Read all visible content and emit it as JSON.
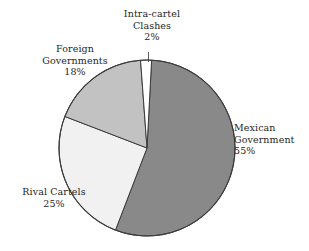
{
  "chart_data": {
    "type": "pie",
    "title": "",
    "subtitle": "",
    "xlabel": "",
    "ylabel": "",
    "legend_position": "none",
    "grid": false,
    "labels_inline": true,
    "units": "percent",
    "total": 100,
    "categories": [
      "Mexican Government",
      "Rival Cartels",
      "Foreign Governments",
      "Intra-cartel Clashes"
    ],
    "values": [
      55,
      25,
      18,
      2
    ],
    "value_labels": [
      "55%",
      "25%",
      "18%",
      "2%"
    ],
    "colors": [
      "#898989",
      "#f1f1f1",
      "#c2c2c2",
      "#ffffff"
    ],
    "start_angle_deg": 3,
    "direction": "clockwise",
    "slices": [
      {
        "name": "Mexican Government",
        "label_line1": "Mexican",
        "label_line2": "Government",
        "value": 55,
        "value_label": "55%",
        "color": "#898989",
        "start_deg": 3,
        "end_deg": 201
      },
      {
        "name": "Rival Cartels",
        "label_line1": "Rival Cartels",
        "label_line2": "",
        "value": 25,
        "value_label": "25%",
        "color": "#f1f1f1",
        "start_deg": 201,
        "end_deg": 291
      },
      {
        "name": "Foreign Governments",
        "label_line1": "Foreign",
        "label_line2": "Governments",
        "value": 18,
        "value_label": "18%",
        "color": "#c2c2c2",
        "start_deg": 291,
        "end_deg": 355.8
      },
      {
        "name": "Intra-cartel Clashes",
        "label_line1": "Intra-cartel",
        "label_line2": "Clashes",
        "value": 2,
        "value_label": "2%",
        "color": "#ffffff",
        "start_deg": 355.8,
        "end_deg": 363
      }
    ]
  },
  "labels": {
    "intra_cartel": {
      "line1": "Intra-cartel",
      "line2": "Clashes",
      "line3": "2%"
    },
    "foreign_governments": {
      "line1": "Foreign",
      "line2": "Governments",
      "line3": "18%"
    },
    "rival_cartels": {
      "line1": "Rival Cartels",
      "line2": "25%"
    },
    "mexican_government": {
      "line1": "Mexican",
      "line2": "Government",
      "line3": "55%"
    }
  },
  "style": {
    "outline_color": "#3b3b3b",
    "background": "#ffffff",
    "leader_line_color": "#4a4a4a"
  }
}
